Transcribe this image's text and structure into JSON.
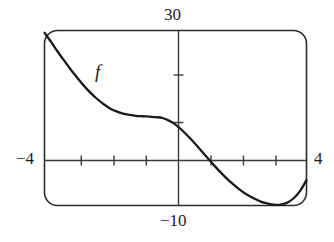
{
  "figure": {
    "name": "graphing-calculator-viewing-window",
    "curve_label": "f",
    "axis_labels": {
      "top": "30",
      "bottom": "−10",
      "left": "−4",
      "right": "4"
    },
    "colors": {
      "background": "#ffffff",
      "frame": "#2b2b2b",
      "axis": "#3a3a3a",
      "curve": "#1a1a1a",
      "text": "#1a1a1a"
    }
  },
  "chart_data": {
    "type": "line",
    "title": "",
    "subtitle": "",
    "xlabel": "",
    "ylabel": "",
    "xlim": [
      -4,
      4
    ],
    "ylim": [
      -10,
      30
    ],
    "grid": false,
    "legend": "none",
    "annotations": [
      {
        "text": "f",
        "x": -2.35,
        "y": 21.5,
        "style": "italic",
        "role": "curve-label"
      },
      {
        "text": "30",
        "x": 0,
        "y": 30,
        "role": "y-max-label"
      },
      {
        "text": "−10",
        "x": 0,
        "y": -10,
        "role": "y-min-label"
      },
      {
        "text": "−4",
        "x": -4,
        "y": 0,
        "role": "x-min-label"
      },
      {
        "text": "4",
        "x": 4,
        "y": 0,
        "role": "x-max-label"
      }
    ],
    "xticks": [
      -3,
      -2,
      -1,
      1,
      2,
      3
    ],
    "yticks": [
      10,
      20
    ],
    "xtick_labels": [
      "",
      "",
      "",
      "",
      "",
      ""
    ],
    "ytick_labels": [
      "",
      ""
    ],
    "series": [
      {
        "name": "f",
        "x": [
          -4.0,
          -3.8,
          -3.6,
          -3.4,
          -3.2,
          -3.0,
          -2.8,
          -2.6,
          -2.4,
          -2.2,
          -2.0,
          -1.8,
          -1.6,
          -1.4,
          -1.2,
          -1.0,
          -0.8,
          -0.6,
          -0.4,
          -0.2,
          0.0,
          0.2,
          0.4,
          0.6,
          0.8,
          1.0,
          1.2,
          1.4,
          1.6,
          1.8,
          2.0,
          2.2,
          2.4,
          2.6,
          2.8,
          3.0,
          3.2,
          3.4,
          3.6,
          3.8,
          4.0
        ],
        "y": [
          29.5,
          27.4,
          25.2,
          23.1,
          21.1,
          19.2,
          17.4,
          15.8,
          14.4,
          13.2,
          12.2,
          11.5,
          11.0,
          10.7,
          10.5,
          10.4,
          10.3,
          10.2,
          10.0,
          9.4,
          8.5,
          7.2,
          5.7,
          4.1,
          2.4,
          0.7,
          -1.0,
          -2.6,
          -4.1,
          -5.4,
          -6.6,
          -7.6,
          -8.4,
          -9.1,
          -9.5,
          -9.8,
          -9.8,
          -9.4,
          -8.4,
          -6.7,
          -4.2
        ]
      }
    ]
  }
}
